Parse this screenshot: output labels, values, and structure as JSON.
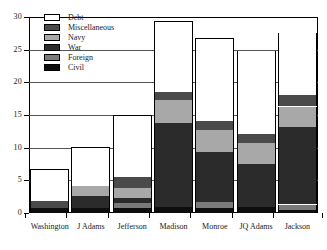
{
  "chart_data": {
    "type": "bar",
    "subtype": "stacked",
    "title": "",
    "xlabel": "",
    "ylabel": "",
    "ylim": [
      0,
      30
    ],
    "yticks": [
      0,
      5,
      10,
      15,
      20,
      25,
      30
    ],
    "ytick_labels": [
      "0",
      "5",
      "10",
      "15",
      "20",
      "25",
      "30"
    ],
    "grid": true,
    "grid_axis": "y",
    "legend_position": "top-left-inside",
    "categories": [
      "Washington",
      "J Adams",
      "Jefferson",
      "Madison",
      "Monroe",
      "JQ Adams",
      "Jackson"
    ],
    "series": [
      {
        "name": "Civil",
        "color": "#0d0d0d",
        "values": [
          0.7,
          0.7,
          0.8,
          0.9,
          0.8,
          0.9,
          0.5
        ]
      },
      {
        "name": "Foreign",
        "color": "#7a7a7a",
        "values": [
          0.0,
          0.0,
          0.8,
          0.0,
          0.9,
          0.0,
          0.8
        ]
      },
      {
        "name": "War",
        "color": "#2b2b2b",
        "values": [
          0.0,
          1.9,
          0.7,
          12.9,
          7.6,
          6.6,
          11.8
        ]
      },
      {
        "name": "Navy",
        "color": "#a8a8a8",
        "values": [
          0.0,
          1.5,
          1.6,
          3.5,
          3.4,
          3.2,
          3.2
        ]
      },
      {
        "name": "Miscellaneous",
        "color": "#4a4a4a",
        "values": [
          1.2,
          0.0,
          1.6,
          1.2,
          1.4,
          1.4,
          1.7
        ]
      },
      {
        "name": "Debt",
        "color": "#ffffff",
        "values": [
          4.8,
          6.0,
          9.5,
          10.9,
          12.7,
          12.7,
          9.5
        ]
      }
    ],
    "totals": [
      6.7,
      10.1,
      15.0,
      29.4,
      26.8,
      26.8,
      27.4
    ]
  },
  "legend": {
    "items": [
      {
        "label": "Debt",
        "color": "#ffffff",
        "swatch_name": "legend-swatch-debt"
      },
      {
        "label": "Miscellaneous",
        "color": "#4a4a4a",
        "swatch_name": "legend-swatch-miscellaneous"
      },
      {
        "label": "Navy",
        "color": "#a8a8a8",
        "swatch_name": "legend-swatch-navy"
      },
      {
        "label": "War",
        "color": "#2b2b2b",
        "swatch_name": "legend-swatch-war"
      },
      {
        "label": "Foreign",
        "color": "#7a7a7a",
        "swatch_name": "legend-swatch-foreign"
      },
      {
        "label": "Civil",
        "color": "#0d0d0d",
        "swatch_name": "legend-swatch-civil"
      }
    ]
  },
  "axes": {
    "plot_left_px": 29,
    "plot_top_px": 17,
    "plot_width_px": 289,
    "plot_height_px": 196
  }
}
